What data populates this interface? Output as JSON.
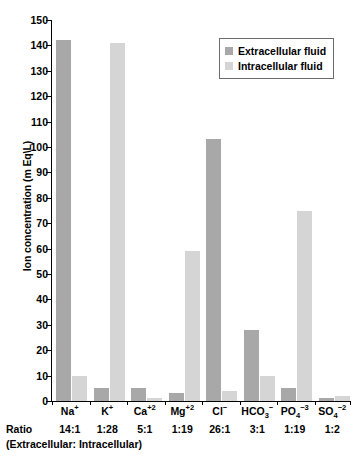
{
  "chart_data": {
    "type": "bar",
    "title": "",
    "xlabel": "",
    "ylabel": "Ion concentration (m Eq\\L)",
    "ylim": [
      0,
      150
    ],
    "ytick_step": 10,
    "grid": false,
    "legend_position": "top-right",
    "categories": [
      "Na",
      "K",
      "Ca",
      "Mg",
      "Cl",
      "HCO",
      "PO",
      "SO"
    ],
    "category_labels": [
      {
        "base": "Na",
        "sub": "",
        "sup": "+"
      },
      {
        "base": "K",
        "sub": "",
        "sup": "+"
      },
      {
        "base": "Ca",
        "sub": "",
        "sup": "+2"
      },
      {
        "base": "Mg",
        "sub": "",
        "sup": "+2"
      },
      {
        "base": "Cl",
        "sub": "",
        "sup": "−"
      },
      {
        "base": "HCO",
        "sub": "3",
        "sup": "−"
      },
      {
        "base": "PO",
        "sub": "4",
        "sup": "−3"
      },
      {
        "base": "SO",
        "sub": "4",
        "sup": "−2"
      }
    ],
    "series": [
      {
        "name": "Extracellular fluid",
        "color": "#a8a8a8",
        "values": [
          142,
          5,
          5,
          3,
          103,
          28,
          5,
          1
        ]
      },
      {
        "name": "Intracellular fluid",
        "color": "#d5d5d5",
        "values": [
          10,
          141,
          1,
          59,
          4,
          10,
          75,
          2
        ]
      }
    ],
    "ytick_labels": [
      "0",
      "10",
      "20",
      "30",
      "40",
      "50",
      "60",
      "70",
      "80",
      "90",
      "100",
      "110",
      "120",
      "130",
      "140",
      "150"
    ],
    "ratios": [
      "14:1",
      "1:28",
      "5:1",
      "1:19",
      "26:1",
      "3:1",
      "1:19",
      "1:2"
    ],
    "ratio_row_title": "Ratio",
    "ratio_row_subtitle": "(Extracellular: Intracellular)"
  },
  "legend": {
    "items": [
      {
        "label": "Extracellular fluid",
        "color": "#a8a8a8"
      },
      {
        "label": "Intracellular fluid",
        "color": "#d5d5d5"
      }
    ]
  }
}
